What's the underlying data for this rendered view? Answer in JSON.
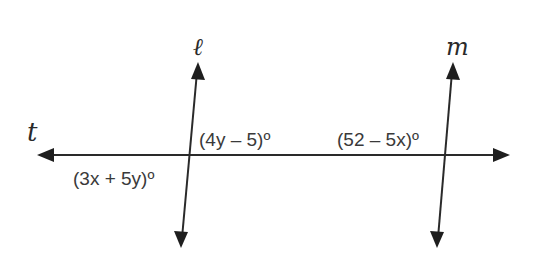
{
  "diagram": {
    "type": "parallel lines cut by a transversal",
    "lines": {
      "transversal": {
        "name": "t",
        "label": "t"
      },
      "left_line": {
        "name": "ℓ",
        "label": "ℓ"
      },
      "right_line": {
        "name": "m",
        "label": "m"
      }
    },
    "angles": {
      "left_bottom_left": {
        "label": "(3x + 5y)º",
        "position": "below t, left of ℓ"
      },
      "left_top_right": {
        "label": "(4y – 5)º",
        "position": "above t, right of ℓ"
      },
      "right_top_left": {
        "label": "(52 – 5x)º",
        "position": "above t, left of m"
      }
    },
    "colors": {
      "stroke": "#2a2a2a",
      "background": "#ffffff"
    }
  }
}
